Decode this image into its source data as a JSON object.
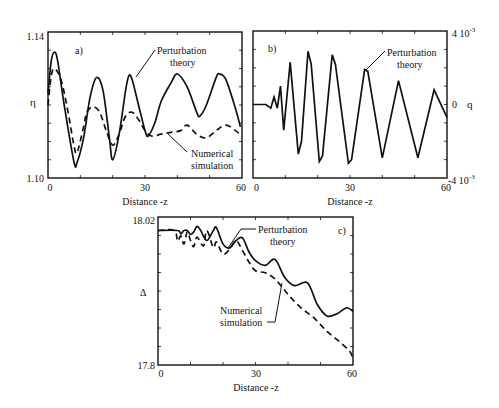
{
  "chart_data": [
    {
      "panel": "a)",
      "type": "line",
      "xlabel": "Distance -z",
      "ylabel": "η",
      "xlim": [
        0,
        60
      ],
      "ylim": [
        1.1,
        1.14
      ],
      "xticks": [
        "0",
        "30",
        "60"
      ],
      "yticks": [
        "1.10",
        "1.14"
      ],
      "annotations": [
        "Perturbation theory",
        "Numerical simulation"
      ],
      "series": [
        {
          "name": "Perturbation theory",
          "style": "solid",
          "x": [
            0,
            1,
            2,
            3,
            5,
            8,
            9,
            11,
            13,
            15,
            17,
            19,
            20,
            22,
            24,
            25,
            26,
            28,
            30,
            31,
            33,
            35,
            38,
            40,
            43,
            46,
            47,
            49,
            52,
            53,
            55,
            58,
            59.5
          ],
          "y": [
            1.123,
            1.132,
            1.1345,
            1.132,
            1.12,
            1.1045,
            1.1043,
            1.111,
            1.122,
            1.1275,
            1.124,
            1.111,
            1.105,
            1.112,
            1.124,
            1.128,
            1.127,
            1.12,
            1.113,
            1.1115,
            1.115,
            1.121,
            1.126,
            1.1285,
            1.125,
            1.118,
            1.117,
            1.12,
            1.1275,
            1.1285,
            1.127,
            1.119,
            1.114
          ]
        },
        {
          "name": "Numerical simulation",
          "style": "dashed",
          "x": [
            0,
            1,
            2,
            4,
            6,
            8,
            9,
            11,
            12,
            14,
            16,
            18,
            20,
            22,
            24,
            26,
            28,
            30,
            32,
            35,
            38,
            41,
            43,
            46,
            49,
            52,
            55,
            58,
            60
          ],
          "y": [
            1.12,
            1.128,
            1.13,
            1.127,
            1.119,
            1.109,
            1.107,
            1.114,
            1.118,
            1.1195,
            1.118,
            1.113,
            1.109,
            1.112,
            1.117,
            1.118,
            1.116,
            1.113,
            1.1115,
            1.112,
            1.1125,
            1.113,
            1.1145,
            1.112,
            1.111,
            1.113,
            1.1145,
            1.113,
            1.1115
          ]
        }
      ]
    },
    {
      "panel": "b)",
      "type": "line",
      "xlabel": "Distance -z",
      "ylabel": "q",
      "xlim": [
        0,
        60
      ],
      "ylim": [
        -0.004,
        0.004
      ],
      "xticks": [
        "0",
        "30",
        "60"
      ],
      "yticks_right": [
        "4 10-3",
        "0",
        "-4 10-3"
      ],
      "annotations": [
        "Perturbation theory"
      ],
      "series": [
        {
          "name": "Perturbation theory",
          "style": "solid",
          "x": [
            0,
            4,
            5.5,
            6.5,
            7.5,
            8.5,
            9.5,
            11.5,
            14,
            15,
            17,
            18,
            20.5,
            21.5,
            24.5,
            25.5,
            29.5,
            30.5,
            34.5,
            35.5,
            40,
            45,
            51,
            56,
            60
          ],
          "y": [
            0,
            0,
            -0.0002,
            0.0004,
            -0.0002,
            0.001,
            -0.0014,
            0.0023,
            -0.0027,
            -0.002,
            0.0029,
            0.0022,
            -0.0031,
            -0.0028,
            0.0027,
            0.0022,
            -0.0032,
            -0.003,
            0.0019,
            0.0018,
            -0.0029,
            0.0013,
            -0.0029,
            0.0008,
            -0.0007
          ]
        }
      ]
    },
    {
      "panel": "c)",
      "type": "line",
      "xlabel": "Distance -z",
      "ylabel": "Δ",
      "xlim": [
        0,
        60
      ],
      "ylim": [
        17.8,
        18.02
      ],
      "xticks": [
        "0",
        "30",
        "60"
      ],
      "yticks": [
        "17.8",
        "18.02"
      ],
      "annotations": [
        "Perturbation theory",
        "Numerical simulation"
      ],
      "series": [
        {
          "name": "Perturbation theory",
          "style": "solid",
          "x": [
            0,
            6,
            7,
            8,
            9,
            10,
            11,
            12,
            13,
            15,
            17,
            18,
            20,
            22,
            24,
            26,
            28,
            30,
            33,
            36,
            39,
            42,
            46,
            49,
            52,
            55,
            58,
            60
          ],
          "y": [
            18.0,
            18.0,
            17.995,
            18.0,
            18.0,
            17.994,
            17.998,
            18.006,
            18.001,
            17.985,
            18.0,
            18.004,
            17.98,
            17.974,
            17.985,
            17.989,
            17.968,
            17.955,
            17.948,
            17.957,
            17.93,
            17.918,
            17.922,
            17.89,
            17.873,
            17.876,
            17.885,
            17.88
          ]
        },
        {
          "name": "Numerical simulation",
          "style": "dashed",
          "x": [
            0,
            5,
            6,
            7,
            8,
            9,
            10,
            11,
            12,
            14,
            15,
            17,
            18,
            20,
            22,
            24,
            26,
            28,
            30,
            33,
            36,
            40,
            44,
            48,
            52,
            56,
            59,
            60
          ],
          "y": [
            18.0,
            18.0,
            17.984,
            17.992,
            17.98,
            17.998,
            17.985,
            17.976,
            17.99,
            17.977,
            18.0,
            17.975,
            17.983,
            17.965,
            17.972,
            17.985,
            17.97,
            17.953,
            17.94,
            17.937,
            17.928,
            17.905,
            17.885,
            17.87,
            17.85,
            17.834,
            17.82,
            17.81
          ]
        }
      ]
    }
  ],
  "labels": {
    "a": {
      "panel": "a)",
      "ylabel": "η",
      "xlabel": "Distance -z",
      "ytop": "1.14",
      "ybot": "1.10",
      "x0": "0",
      "x30": "30",
      "x60": "60",
      "ann1a": "Perturbation",
      "ann1b": "theory",
      "ann2a": "Numerical",
      "ann2b": "simulation"
    },
    "b": {
      "panel": "b)",
      "ylabel": "q",
      "xlabel": "Distance -z",
      "ytop": "4 10",
      "ytop_exp": "-3",
      "ymid": "0",
      "ybot": "-4 10",
      "ybot_exp": "-3",
      "x0": "0",
      "x30": "30",
      "x60": "60",
      "ann1a": "Perturbation",
      "ann1b": "theory"
    },
    "c": {
      "panel": "c)",
      "ylabel": "Δ",
      "xlabel": "Distance -z",
      "ytop": "18.02",
      "ybot": "17.8",
      "x0": "0",
      "x30": "30",
      "x60": "60",
      "ann1a": "Perturbation",
      "ann1b": "theory",
      "ann2a": "Numerical",
      "ann2b": "simulation"
    }
  },
  "colors": {
    "line": "#111111",
    "frame": "#111111",
    "background": "#ffffff"
  }
}
